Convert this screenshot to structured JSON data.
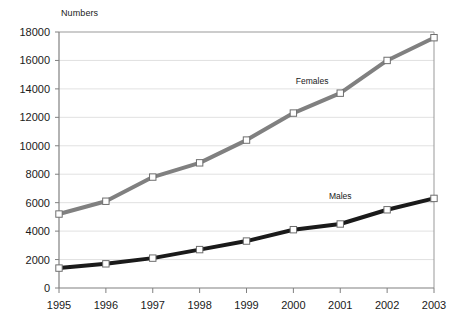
{
  "chart_data": {
    "type": "line",
    "title": "",
    "ylabel": "Numbers",
    "xlabel": "",
    "categories": [
      "1995",
      "1996",
      "1997",
      "1998",
      "1999",
      "2000",
      "2001",
      "2002",
      "2003"
    ],
    "x": [
      1995,
      1996,
      1997,
      1998,
      1999,
      2000,
      2001,
      2002,
      2003
    ],
    "ylim": [
      0,
      18000
    ],
    "ytick_labels": [
      "18000",
      "16000",
      "14000",
      "12000",
      "10000",
      "8000",
      "6000",
      "4000",
      "2000",
      "0"
    ],
    "ytick_values": [
      18000,
      16000,
      14000,
      12000,
      10000,
      8000,
      6000,
      4000,
      2000,
      0
    ],
    "grid": true,
    "grid_axis": "y",
    "legend_position": "inline-labels",
    "series": [
      {
        "name": "Females",
        "color": "#808080",
        "marker": "square-open",
        "values": [
          5200,
          6100,
          7800,
          8800,
          10400,
          12300,
          13700,
          16000,
          17600
        ]
      },
      {
        "name": "Males",
        "color": "#1a1a1a",
        "marker": "square-open",
        "values": [
          1400,
          1700,
          2100,
          2700,
          3300,
          4100,
          4500,
          5500,
          6300
        ]
      }
    ],
    "annotations": [
      {
        "text": "Females",
        "x": 2000.4,
        "y": 14550
      },
      {
        "text": "Males",
        "x": 2001.0,
        "y": 6450
      }
    ]
  },
  "colors": {
    "females_line": "#808080",
    "males_line": "#1a1a1a",
    "axis": "#808080",
    "grid": "#d9d9d9",
    "text": "#1a1a1a",
    "marker_fill": "#ffffff",
    "background": "#ffffff"
  }
}
